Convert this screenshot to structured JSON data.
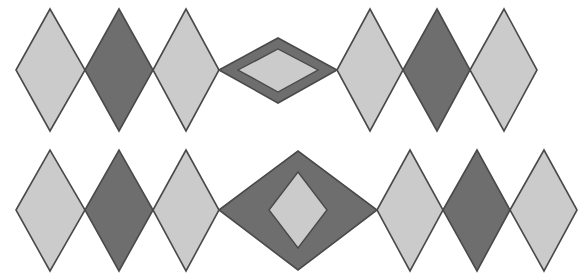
{
  "figure": {
    "width": 588,
    "height": 277,
    "background_color": "#ffffff"
  },
  "palette": {
    "light_fill": "#cbcbcb",
    "dark_fill": "#6e6e6e",
    "outline": "#4a4a4a",
    "background": "#ffffff"
  },
  "rows": [
    {
      "name": "top-row",
      "center_y": 70,
      "shapes": [
        {
          "name": "diamond-1",
          "kind": "solid",
          "tone": "light",
          "fill": "#cbcbcb",
          "points": "16,70 50,9 85,70 50,131"
        },
        {
          "name": "diamond-2",
          "kind": "solid",
          "tone": "dark",
          "fill": "#6e6e6e",
          "points": "85,70 119,9 153,70 119,131"
        },
        {
          "name": "diamond-3",
          "kind": "solid",
          "tone": "light",
          "fill": "#cbcbcb",
          "points": "153,70 186,9 219,70 186,131"
        },
        {
          "name": "diamond-4-nested-outer",
          "kind": "nested-outer",
          "tone": "dark",
          "fill": "#6e6e6e",
          "points": "219,70 278,38 337,70 278,103"
        },
        {
          "name": "diamond-4-nested-inner",
          "kind": "nested-inner",
          "tone": "light",
          "fill": "#cbcbcb",
          "points": "238,70 278,49 318,70 278,92"
        },
        {
          "name": "diamond-5",
          "kind": "solid",
          "tone": "light",
          "fill": "#cbcbcb",
          "points": "337,70 370,9 403,70 370,131"
        },
        {
          "name": "diamond-6",
          "kind": "solid",
          "tone": "dark",
          "fill": "#6e6e6e",
          "points": "403,70 437,9 470,70 437,131"
        },
        {
          "name": "diamond-7",
          "kind": "solid",
          "tone": "light",
          "fill": "#cbcbcb",
          "points": "470,70 504,9 537,70 504,131"
        }
      ]
    },
    {
      "name": "bottom-row",
      "center_y": 210,
      "shapes": [
        {
          "name": "diamond-1",
          "kind": "solid",
          "tone": "light",
          "fill": "#cbcbcb",
          "points": "16,210 50,150 85,210 50,271"
        },
        {
          "name": "diamond-2",
          "kind": "solid",
          "tone": "dark",
          "fill": "#6e6e6e",
          "points": "85,210 119,150 153,210 119,271"
        },
        {
          "name": "diamond-3",
          "kind": "solid",
          "tone": "light",
          "fill": "#cbcbcb",
          "points": "153,210 186,150 219,210 186,271"
        },
        {
          "name": "diamond-4-nested-outer",
          "kind": "nested-outer",
          "tone": "dark",
          "fill": "#6e6e6e",
          "points": "219,210 298,151 377,210 298,270"
        },
        {
          "name": "diamond-4-nested-inner",
          "kind": "nested-inner",
          "tone": "light",
          "fill": "#cbcbcb",
          "points": "269,210 298,172 327,210 298,248"
        },
        {
          "name": "diamond-5",
          "kind": "solid",
          "tone": "light",
          "fill": "#cbcbcb",
          "points": "377,210 410,150 443,210 410,271"
        },
        {
          "name": "diamond-6",
          "kind": "solid",
          "tone": "dark",
          "fill": "#6e6e6e",
          "points": "443,210 477,150 510,210 477,271"
        },
        {
          "name": "diamond-7",
          "kind": "solid",
          "tone": "light",
          "fill": "#cbcbcb",
          "points": "510,210 544,150 577,210 544,271"
        }
      ]
    }
  ]
}
